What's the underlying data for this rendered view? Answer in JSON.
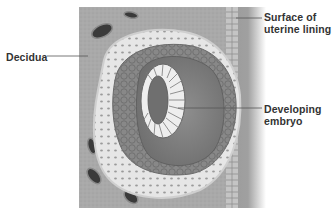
{
  "figure": {
    "labels": {
      "decidua": "Decidua",
      "surface_line1": "Surface of",
      "surface_line2": "uterine lining",
      "embryo_line1": "Developing",
      "embryo_line2": "embryo"
    },
    "colors": {
      "tissue": "#a8a8a8",
      "tissue_dark": "#8c8c8c",
      "lining_light": "#d8d8d8",
      "vessel": "#3a3a3a",
      "leader_line": "#555555",
      "label_text": "#333333"
    }
  }
}
